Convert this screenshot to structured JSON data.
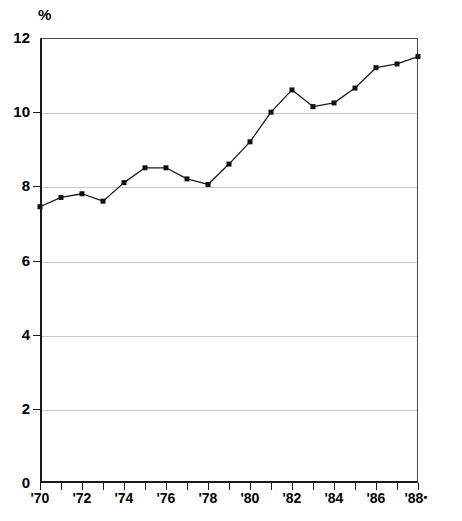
{
  "chart_data": {
    "type": "line",
    "title": "",
    "subtitle": "",
    "xlabel": "",
    "ylabel": "%",
    "unit_label": "%",
    "categories": [
      "'70",
      "'71",
      "'72",
      "'73",
      "'74",
      "'75",
      "'76",
      "'77",
      "'78",
      "'79",
      "'80",
      "'81",
      "'82",
      "'83",
      "'84",
      "'85",
      "'86",
      "'87",
      "'88"
    ],
    "x": [
      1970,
      1971,
      1972,
      1973,
      1974,
      1975,
      1976,
      1977,
      1978,
      1979,
      1980,
      1981,
      1982,
      1983,
      1984,
      1985,
      1986,
      1987,
      1988
    ],
    "values": [
      7.45,
      7.7,
      7.8,
      7.6,
      8.1,
      8.5,
      8.5,
      8.2,
      8.05,
      8.6,
      9.2,
      10.0,
      10.6,
      10.15,
      10.25,
      10.65,
      11.2,
      11.3,
      11.5
    ],
    "series": [
      {
        "name": "",
        "values": [
          7.45,
          7.7,
          7.8,
          7.6,
          8.1,
          8.5,
          8.5,
          8.2,
          8.05,
          8.6,
          9.2,
          10.0,
          10.6,
          10.15,
          10.25,
          10.65,
          11.2,
          11.3,
          11.5
        ]
      }
    ],
    "ylim": [
      0,
      12
    ],
    "xlim": [
      1970,
      1988
    ],
    "ytick_values": [
      0,
      2,
      4,
      6,
      8,
      10,
      12
    ],
    "ytick_labels": [
      "0",
      "2",
      "4",
      "6",
      "8",
      "10",
      "12"
    ],
    "xtick_values": [
      1970,
      1971,
      1972,
      1973,
      1974,
      1975,
      1976,
      1977,
      1978,
      1979,
      1980,
      1981,
      1982,
      1983,
      1984,
      1985,
      1986,
      1987,
      1988
    ],
    "xtick_labels_shown": [
      "'70",
      "'72",
      "'74",
      "'76",
      "'78",
      "'80",
      "'82",
      "'84",
      "'86",
      "'88"
    ],
    "xtick_labels_shown_values": [
      1970,
      1972,
      1974,
      1976,
      1978,
      1980,
      1982,
      1984,
      1986,
      1988
    ],
    "last_label_marker": "•",
    "grid": true,
    "grid_axis": "y",
    "legend": false,
    "legend_position": "none",
    "annotations": [],
    "colors": {
      "line": "#1a1a1a",
      "marker": "#111111",
      "grid": "#c9c9c9",
      "axis": "#1a1a1a",
      "background": "#ffffff"
    },
    "marker_style": "square",
    "line_width": 1.3
  }
}
